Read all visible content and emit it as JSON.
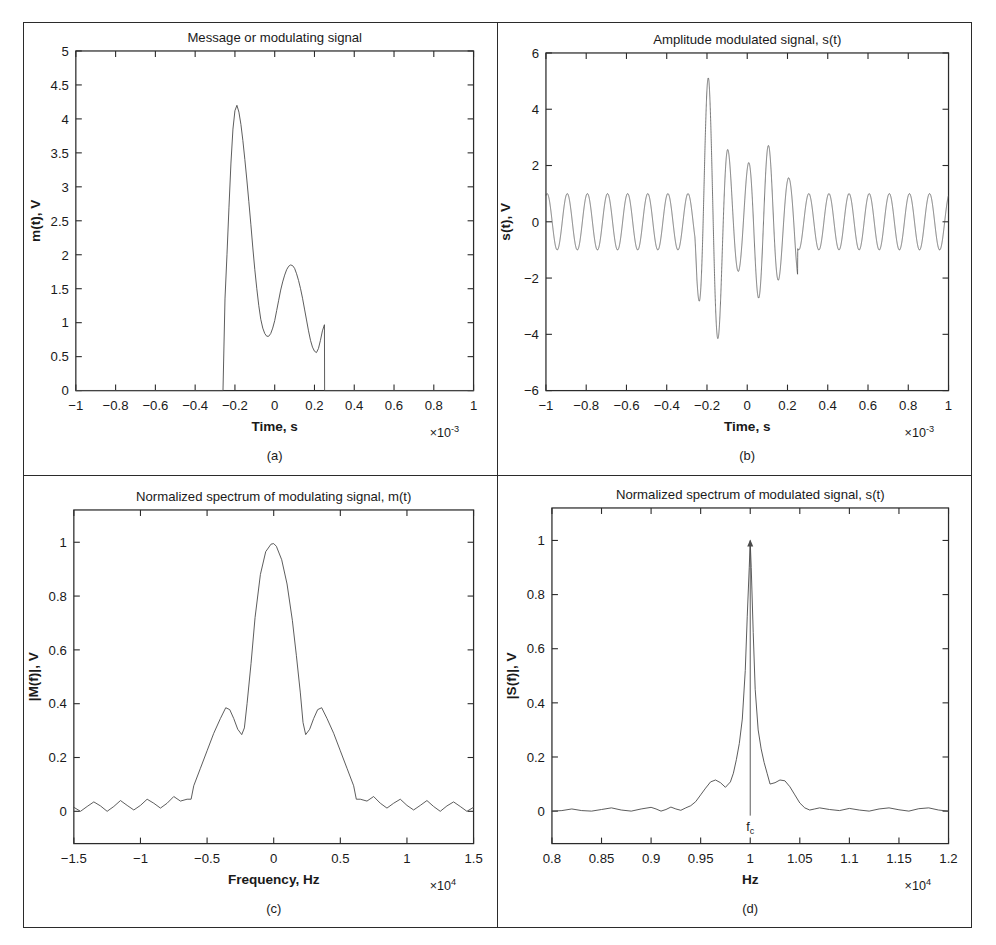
{
  "figure": {
    "panels": [
      "a",
      "b",
      "c",
      "d"
    ],
    "captions": {
      "a": "(a)",
      "b": "(b)",
      "c": "(c)",
      "d": "(d)"
    },
    "line_color": "#4a4a4a",
    "axis_color": "#2b2b2b",
    "background": "#ffffff"
  },
  "chart_data": [
    {
      "id": "a",
      "type": "line",
      "title": "Message or modulating signal",
      "xlabel": "Time, s",
      "ylabel": "m(t), V",
      "x_exponent": "×10",
      "x_exponent_sup": "-3",
      "y_exponent": "",
      "xlim": [
        -1,
        1
      ],
      "ylim": [
        0,
        5
      ],
      "xticks": [
        -1,
        -0.8,
        -0.6,
        -0.4,
        -0.2,
        0,
        0.2,
        0.4,
        0.6,
        0.8,
        1
      ],
      "xticklabels": [
        "−1",
        "−0.8",
        "−0.6",
        "−0.4",
        "−0.2",
        "0",
        "0.2",
        "0.4",
        "0.6",
        "0.8",
        "1"
      ],
      "yticks": [
        0,
        0.5,
        1,
        1.5,
        2,
        2.5,
        3,
        3.5,
        4,
        4.5,
        5
      ],
      "yticklabels": [
        "0",
        "0.5",
        "1",
        "1.5",
        "2",
        "2.5",
        "3",
        "3.5",
        "4",
        "4.5",
        "5"
      ],
      "grid": false,
      "legend": false,
      "series": [
        {
          "name": "m(t)",
          "x": [
            -1.0,
            -0.26,
            -0.25,
            -0.24,
            -0.23,
            -0.22,
            -0.21,
            -0.2,
            -0.19,
            -0.18,
            -0.17,
            -0.16,
            -0.15,
            -0.14,
            -0.13,
            -0.12,
            -0.11,
            -0.1,
            -0.09,
            -0.08,
            -0.07,
            -0.06,
            -0.05,
            -0.04,
            -0.03,
            -0.02,
            -0.01,
            0.0,
            0.01,
            0.02,
            0.03,
            0.04,
            0.05,
            0.06,
            0.07,
            0.08,
            0.09,
            0.1,
            0.11,
            0.12,
            0.13,
            0.14,
            0.15,
            0.16,
            0.17,
            0.18,
            0.19,
            0.2,
            0.21,
            0.22,
            0.23,
            0.24,
            0.25,
            0.251,
            1.0
          ],
          "y": [
            0.0,
            0.0,
            1.35,
            2.0,
            2.7,
            3.35,
            3.85,
            4.12,
            4.2,
            4.1,
            3.92,
            3.68,
            3.4,
            3.1,
            2.78,
            2.45,
            2.1,
            1.78,
            1.5,
            1.25,
            1.05,
            0.92,
            0.84,
            0.8,
            0.8,
            0.84,
            0.92,
            1.03,
            1.18,
            1.33,
            1.48,
            1.6,
            1.7,
            1.78,
            1.83,
            1.85,
            1.84,
            1.8,
            1.72,
            1.62,
            1.5,
            1.36,
            1.2,
            1.04,
            0.88,
            0.74,
            0.64,
            0.58,
            0.56,
            0.62,
            0.74,
            0.88,
            0.97,
            0.0,
            0.0
          ]
        }
      ]
    },
    {
      "id": "b",
      "type": "line",
      "title": "Amplitude modulated signal, s(t)",
      "xlabel": "Time, s",
      "ylabel": "s(t), V",
      "x_exponent": "×10",
      "x_exponent_sup": "-3",
      "xlim": [
        -1,
        1
      ],
      "ylim": [
        -6,
        6
      ],
      "xticks": [
        -1,
        -0.8,
        -0.6,
        -0.4,
        -0.2,
        0,
        0.2,
        0.4,
        0.6,
        0.8,
        1
      ],
      "xticklabels": [
        "−1",
        "−0.8",
        "−0.6",
        "−0.4",
        "−0.2",
        "0",
        "0.2",
        "0.4",
        "0.6",
        "0.8",
        "1"
      ],
      "yticks": [
        -6,
        -4,
        -2,
        0,
        2,
        4,
        6
      ],
      "yticklabels": [
        "−6",
        "−4",
        "−2",
        "0",
        "2",
        "4",
        "6"
      ],
      "grid": false,
      "legend": false,
      "description": "Carrier sinusoid at fc = 10 kHz with unit envelope outside the burst, envelope following m(t)+1 inside -0.25e-3..0.25e-3",
      "carrier_cycles": 20,
      "envelope_base": 1.0,
      "envelope": {
        "x": [
          -1.0,
          -0.26,
          -0.25,
          -0.24,
          -0.23,
          -0.22,
          -0.21,
          -0.2,
          -0.19,
          -0.18,
          -0.17,
          -0.16,
          -0.15,
          -0.14,
          -0.13,
          -0.12,
          -0.11,
          -0.1,
          -0.09,
          -0.08,
          -0.07,
          -0.06,
          -0.05,
          -0.04,
          -0.03,
          -0.02,
          -0.01,
          0.0,
          0.01,
          0.02,
          0.03,
          0.04,
          0.05,
          0.06,
          0.07,
          0.08,
          0.09,
          0.1,
          0.11,
          0.12,
          0.13,
          0.14,
          0.15,
          0.16,
          0.17,
          0.18,
          0.19,
          0.2,
          0.21,
          0.22,
          0.23,
          0.24,
          0.25,
          0.251,
          1.0
        ],
        "y": [
          1.0,
          1.0,
          2.2,
          2.9,
          3.6,
          4.25,
          4.8,
          5.05,
          5.15,
          5.05,
          4.85,
          4.6,
          4.3,
          4.0,
          3.7,
          3.38,
          3.0,
          2.7,
          2.4,
          2.15,
          1.95,
          1.85,
          1.78,
          1.75,
          1.75,
          1.8,
          1.88,
          2.0,
          2.15,
          2.3,
          2.45,
          2.56,
          2.66,
          2.74,
          2.8,
          2.82,
          2.8,
          2.75,
          2.68,
          2.58,
          2.45,
          2.3,
          2.15,
          2.0,
          1.85,
          1.72,
          1.62,
          1.57,
          1.56,
          1.62,
          1.74,
          1.88,
          2.0,
          1.0,
          1.0
        ]
      }
    },
    {
      "id": "c",
      "type": "line",
      "title": "Normalized spectrum of modulating signal, m(t)",
      "xlabel": "Frequency, Hz",
      "ylabel": "|M(f)|, V",
      "x_exponent": "×10",
      "x_exponent_sup": "4",
      "xlim": [
        -1.5,
        1.5
      ],
      "ylim": [
        -0.12,
        1.12
      ],
      "xticks": [
        -1.5,
        -1,
        -0.5,
        0,
        0.5,
        1,
        1.5
      ],
      "xticklabels": [
        "−1.5",
        "−1",
        "−0.5",
        "0",
        "0.5",
        "1",
        "1.5"
      ],
      "yticks": [
        0,
        0.2,
        0.4,
        0.6,
        0.8,
        1
      ],
      "yticklabels": [
        "0",
        "0.2",
        "0.4",
        "0.6",
        "0.8",
        "1"
      ],
      "grid": false,
      "legend": false,
      "series": [
        {
          "name": "|M(f)|",
          "x": [
            -1.5,
            -1.45,
            -1.4,
            -1.35,
            -1.3,
            -1.25,
            -1.2,
            -1.15,
            -1.1,
            -1.05,
            -1.0,
            -0.95,
            -0.9,
            -0.85,
            -0.8,
            -0.75,
            -0.7,
            -0.65,
            -0.62,
            -0.6,
            -0.55,
            -0.5,
            -0.45,
            -0.4,
            -0.36,
            -0.33,
            -0.3,
            -0.27,
            -0.24,
            -0.22,
            -0.2,
            -0.17,
            -0.14,
            -0.1,
            -0.06,
            -0.02,
            0.0,
            0.02,
            0.06,
            0.1,
            0.14,
            0.17,
            0.2,
            0.22,
            0.24,
            0.27,
            0.3,
            0.33,
            0.36,
            0.4,
            0.45,
            0.5,
            0.55,
            0.6,
            0.62,
            0.65,
            0.7,
            0.75,
            0.8,
            0.85,
            0.9,
            0.95,
            1.0,
            1.05,
            1.1,
            1.15,
            1.2,
            1.25,
            1.3,
            1.35,
            1.4,
            1.45,
            1.5
          ],
          "y": [
            0.015,
            0.0,
            0.018,
            0.035,
            0.02,
            0.0,
            0.018,
            0.04,
            0.022,
            0.005,
            0.022,
            0.045,
            0.03,
            0.012,
            0.03,
            0.055,
            0.038,
            0.045,
            0.045,
            0.095,
            0.16,
            0.225,
            0.29,
            0.345,
            0.385,
            0.378,
            0.345,
            0.305,
            0.285,
            0.31,
            0.4,
            0.55,
            0.72,
            0.88,
            0.965,
            0.993,
            0.995,
            0.985,
            0.935,
            0.845,
            0.71,
            0.58,
            0.44,
            0.33,
            0.285,
            0.305,
            0.345,
            0.378,
            0.385,
            0.345,
            0.29,
            0.225,
            0.16,
            0.095,
            0.045,
            0.045,
            0.038,
            0.055,
            0.03,
            0.012,
            0.03,
            0.045,
            0.022,
            0.005,
            0.022,
            0.04,
            0.018,
            0.0,
            0.02,
            0.035,
            0.018,
            0.0,
            0.015
          ]
        }
      ]
    },
    {
      "id": "d",
      "type": "line",
      "title": "Normalized spectrum of modulated signal, s(t)",
      "xlabel": "Hz",
      "ylabel": "|S(f)|, V",
      "x_exponent": "×10",
      "x_exponent_sup": "4",
      "xlim": [
        0.8,
        1.2
      ],
      "ylim": [
        -0.12,
        1.12
      ],
      "xticks": [
        0.8,
        0.85,
        0.9,
        0.95,
        1,
        1.05,
        1.1,
        1.15,
        1.2
      ],
      "xticklabels": [
        "0.8",
        "0.85",
        "0.9",
        "0.95",
        "1",
        "1.05",
        "1.1",
        "1.15",
        "1.2"
      ],
      "yticks": [
        0,
        0.2,
        0.4,
        0.6,
        0.8,
        1
      ],
      "yticklabels": [
        "0",
        "0.2",
        "0.4",
        "0.6",
        "0.8",
        "1"
      ],
      "grid": false,
      "legend": false,
      "annotation": {
        "label": "f",
        "label_sub": "c",
        "x": 1.0,
        "y_top": 1.0,
        "arrow": true
      },
      "series": [
        {
          "name": "|S(f)|",
          "x": [
            0.8,
            0.81,
            0.82,
            0.83,
            0.84,
            0.85,
            0.86,
            0.87,
            0.88,
            0.89,
            0.9,
            0.905,
            0.91,
            0.915,
            0.92,
            0.925,
            0.93,
            0.935,
            0.94,
            0.945,
            0.95,
            0.955,
            0.96,
            0.965,
            0.97,
            0.975,
            0.98,
            0.983,
            0.986,
            0.989,
            0.992,
            0.995,
            0.997,
            0.999,
            1.0,
            1.001,
            1.003,
            1.005,
            1.008,
            1.011,
            1.014,
            1.017,
            1.02,
            1.025,
            1.03,
            1.035,
            1.04,
            1.045,
            1.05,
            1.055,
            1.06,
            1.065,
            1.07,
            1.08,
            1.09,
            1.1,
            1.11,
            1.12,
            1.13,
            1.14,
            1.15,
            1.16,
            1.17,
            1.18,
            1.19,
            1.2
          ],
          "y": [
            0.0,
            0.002,
            0.008,
            0.002,
            0.0,
            0.006,
            0.012,
            0.004,
            0.0,
            0.008,
            0.014,
            0.008,
            0.0,
            0.006,
            0.015,
            0.008,
            0.003,
            0.012,
            0.02,
            0.035,
            0.06,
            0.085,
            0.108,
            0.115,
            0.105,
            0.088,
            0.108,
            0.14,
            0.19,
            0.25,
            0.34,
            0.52,
            0.72,
            0.9,
            0.995,
            0.9,
            0.66,
            0.45,
            0.3,
            0.23,
            0.18,
            0.14,
            0.1,
            0.105,
            0.115,
            0.112,
            0.09,
            0.06,
            0.03,
            0.012,
            0.004,
            0.008,
            0.012,
            0.006,
            0.002,
            0.01,
            0.004,
            0.0,
            0.008,
            0.012,
            0.005,
            0.0,
            0.009,
            0.012,
            0.004,
            0.0
          ]
        }
      ]
    }
  ]
}
